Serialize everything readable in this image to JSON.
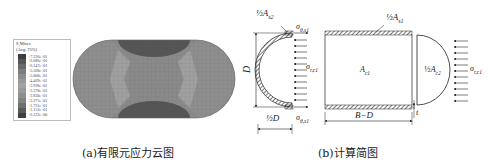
{
  "panel_a": {
    "caption": "(a)有限元应力云图",
    "legend": {
      "title": "S,Mises",
      "subtitle": "(Avg: 75%)",
      "values": [
        "+7.226e+01",
        "+6.686e+01",
        "+6.147e+01",
        "+5.568e+01",
        "+5.008e+01",
        "+4.469e+01",
        "+3.928e+01",
        "+3.378e+01",
        "+2.830e+01",
        "+2.271e+01",
        "+1.731e+01",
        "+1.152e+01",
        "+6.122e+00"
      ],
      "colors": [
        "#3f3f3f",
        "#575757",
        "#6a6a6a",
        "#7d7d7d",
        "#8c8c8c",
        "#999999",
        "#a3a3a3",
        "#9a9a9a",
        "#8f8f8f",
        "#828282",
        "#6f6f6f",
        "#5a5a5a",
        "#404040"
      ]
    },
    "contour_colors": {
      "body": "#8a8a8a",
      "high_stress": "#505050",
      "light_region": "#a5a5a5",
      "mesh": "#6a6a6a"
    }
  },
  "panel_b": {
    "caption": "(b)计算简图",
    "left_sketch": {
      "label_area_top": "½A",
      "label_area_sub": "s2",
      "label_sigma_top": "σ",
      "label_sigma_top_sub": "θ,s1",
      "label_sigma_bottom": "σ",
      "label_sigma_bottom_sub": "θ,s1",
      "label_sigma_r": "σ",
      "label_sigma_r_sub": "r,c1",
      "label_D": "D",
      "label_half_D": "½D"
    },
    "right_sketch": {
      "label_area_top": "½A",
      "label_area_top_sub": "s1",
      "label_core": "A",
      "label_core_sub": "c1",
      "label_semi": "½A",
      "label_semi_sub": "c2",
      "label_sigma_r": "σ",
      "label_sigma_r_sub": "r,c1",
      "label_length": "B−D",
      "label_t": "t"
    }
  }
}
